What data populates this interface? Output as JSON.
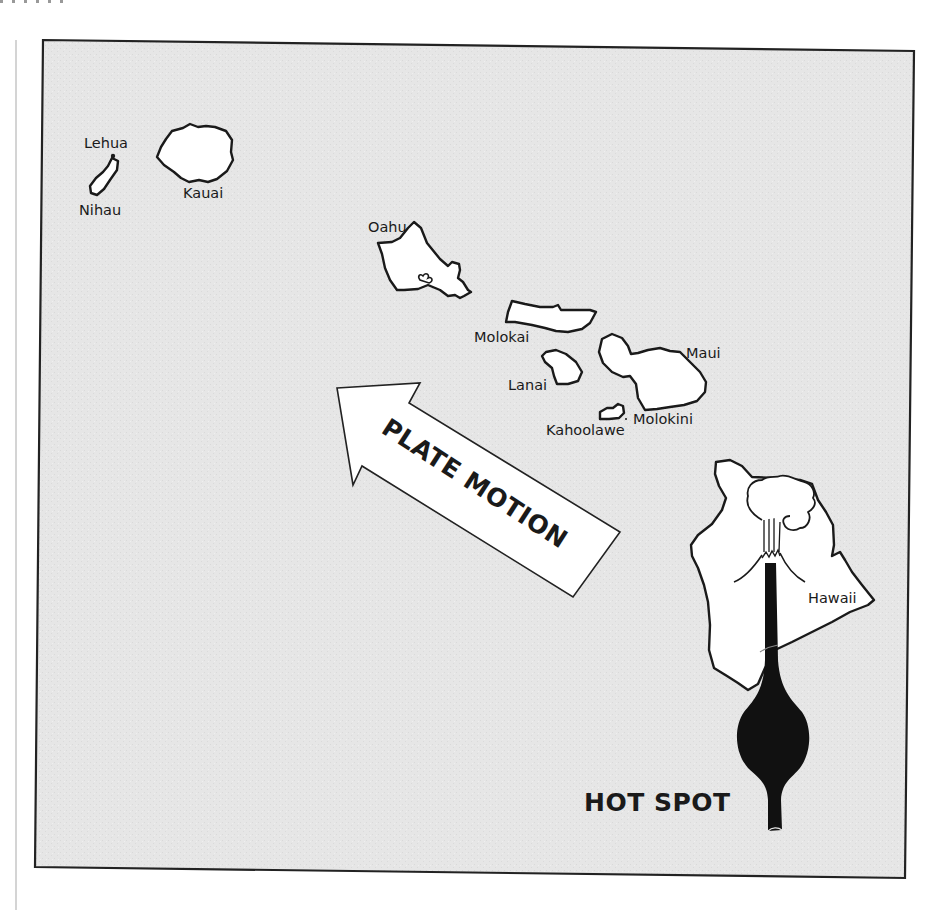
{
  "figure": {
    "title_labels": {
      "plate_motion": "PLATE MOTION",
      "hot_spot": "HOT SPOT"
    },
    "colors": {
      "ocean": "#e6e6e6",
      "land": "#ffffff",
      "outline": "#1a1a1a",
      "plume": "#111111"
    }
  },
  "islands": [
    {
      "name": "Lehua",
      "label": "Lehua"
    },
    {
      "name": "Nihau",
      "label": "Nihau"
    },
    {
      "name": "Kauai",
      "label": "Kauai"
    },
    {
      "name": "Oahu",
      "label": "Oahu"
    },
    {
      "name": "Molokai",
      "label": "Molokai"
    },
    {
      "name": "Lanai",
      "label": "Lanai"
    },
    {
      "name": "Maui",
      "label": "Maui"
    },
    {
      "name": "Kahoolawe",
      "label": "Kahoolawe"
    },
    {
      "name": "Molokini",
      "label": "Molokini"
    },
    {
      "name": "Hawaii",
      "label": "Hawaii"
    }
  ]
}
